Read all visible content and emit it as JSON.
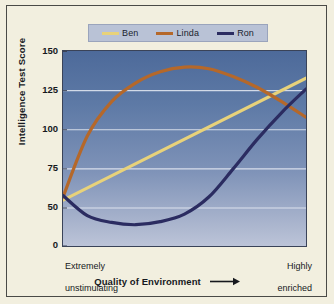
{
  "chart_data": {
    "type": "line",
    "title": "",
    "xlabel": "Quality of Environment",
    "ylabel": "Intelligence Test Score",
    "ylim": [
      0,
      150
    ],
    "yticks": [
      "0",
      "50",
      "75",
      "100",
      "125",
      "150"
    ],
    "ytick_values": [
      0,
      50,
      75,
      100,
      125,
      150
    ],
    "grid": "horizontal",
    "legend_position": "top",
    "x_axis_endpoints": {
      "left": "Extremely\nunstimulating",
      "right": "Highly\nenriched"
    },
    "x_axis_arrow": "right-arrow",
    "x": [
      0,
      0.1,
      0.2,
      0.3,
      0.4,
      0.5,
      0.6,
      0.7,
      0.8,
      0.9,
      1.0
    ],
    "series": [
      {
        "name": "Ben",
        "color": "#e8d27a",
        "shape": "straight line, steady increase",
        "values": [
          55,
          63,
          71,
          79,
          86,
          94,
          102,
          110,
          118,
          126,
          133
        ]
      },
      {
        "name": "Linda",
        "color": "#b5682a",
        "shape": "steep rise then peak and decline",
        "values": [
          57,
          96,
          118,
          130,
          137,
          140,
          139,
          134,
          127,
          118,
          108
        ]
      },
      {
        "name": "Ron",
        "color": "#2b2c61",
        "shape": "dips to minimum then rises",
        "values": [
          58,
          40,
          31,
          28,
          32,
          42,
          57,
          75,
          94,
          111,
          126
        ]
      }
    ]
  },
  "legend": {
    "items": [
      {
        "label": "Ben",
        "color": "#e8d27a"
      },
      {
        "label": "Linda",
        "color": "#b5682a"
      },
      {
        "label": "Ron",
        "color": "#2b2c61"
      }
    ]
  },
  "axes": {
    "y_title": "Intelligence Test Score",
    "x_title": "Quality of Environment",
    "x_left_line1": "Extremely",
    "x_left_line2": "unstimulating",
    "x_right_line1": "Highly",
    "x_right_line2": "enriched"
  },
  "colors": {
    "page_background": "#f2efdf",
    "frame_border": "#4a4a46",
    "legend_background": "#b9c2d6",
    "plot_top": "#4d6a9a",
    "plot_bottom": "#bcc4d8",
    "gridline": "#e8ecf5",
    "text": "#16181d"
  }
}
